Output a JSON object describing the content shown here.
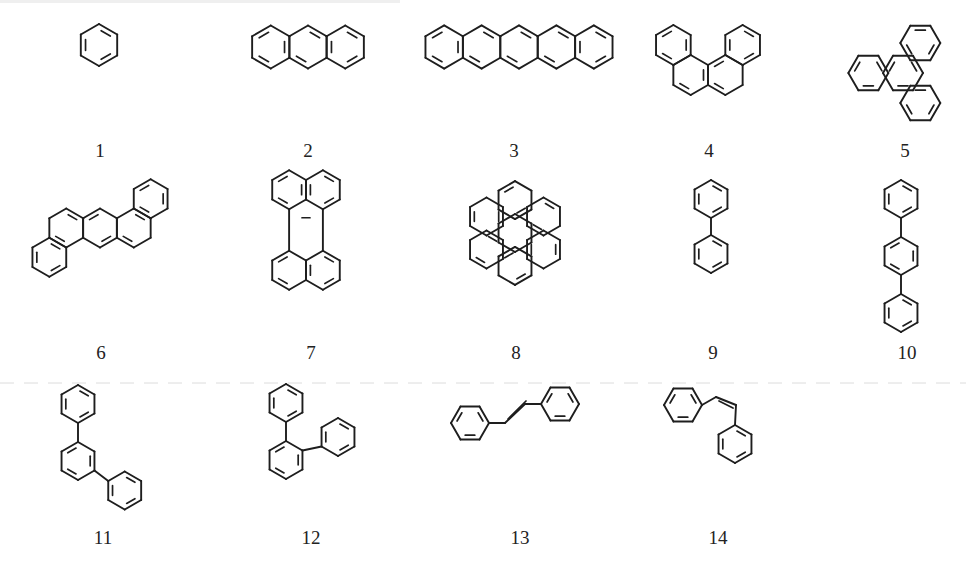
{
  "figure": {
    "compounds": [
      {
        "label": "1",
        "name": "benzene"
      },
      {
        "label": "2",
        "name": "anthracene"
      },
      {
        "label": "3",
        "name": "pentacene"
      },
      {
        "label": "4",
        "name": "benzo[c]phenanthrene"
      },
      {
        "label": "5",
        "name": "triphenylene"
      },
      {
        "label": "6",
        "name": "dibenz[a,h]anthracene"
      },
      {
        "label": "7",
        "name": "perylene"
      },
      {
        "label": "8",
        "name": "coronene"
      },
      {
        "label": "9",
        "name": "biphenyl"
      },
      {
        "label": "10",
        "name": "p-terphenyl"
      },
      {
        "label": "11",
        "name": "m-terphenyl"
      },
      {
        "label": "12",
        "name": "o-terphenyl"
      },
      {
        "label": "13",
        "name": "trans-stilbene"
      },
      {
        "label": "14",
        "name": "cis-stilbene"
      }
    ]
  }
}
